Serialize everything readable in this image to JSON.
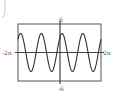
{
  "chart_data": {
    "type": "line",
    "title": "",
    "xlabel": "",
    "ylabel": "",
    "xlim": [
      -6.2832,
      6.2832
    ],
    "ylim": [
      -6,
      6
    ],
    "x_tick_labels": [
      "-2π",
      "2π"
    ],
    "y_tick_labels": [
      "6",
      "-6"
    ],
    "grid": false,
    "legend": null,
    "series": [
      {
        "name": "y ≈ 4 sin(2x + π/4)",
        "function": "4*sin(2*x + pi/4)",
        "amplitude": 4,
        "period": 3.1416,
        "phase": 0.7854,
        "x": [
          -6.28,
          -5.5,
          -4.71,
          -3.93,
          -3.14,
          -2.36,
          -1.57,
          -0.79,
          0.0,
          0.39,
          0.79,
          1.57,
          2.36,
          3.14,
          3.93,
          4.71,
          5.5,
          6.28
        ],
        "y": [
          2.83,
          2.83,
          -2.83,
          -2.83,
          2.83,
          2.83,
          -2.83,
          -2.83,
          2.83,
          4.0,
          2.83,
          -2.83,
          -2.83,
          2.83,
          2.83,
          -2.83,
          -2.83,
          2.83
        ]
      }
    ]
  },
  "labels": {
    "ymax": "6",
    "ymin": "-6",
    "xmin": "-2π",
    "xmax": "2π"
  },
  "colors": {
    "line": "#333333",
    "axes": "#444444",
    "frame": "#555555",
    "background": "#ffffff"
  }
}
